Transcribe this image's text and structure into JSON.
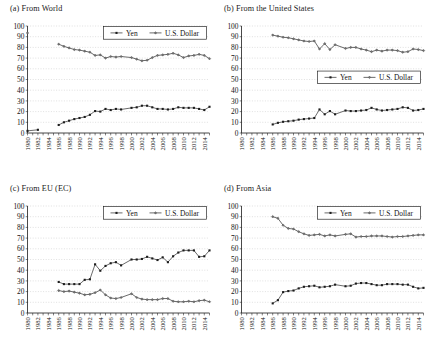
{
  "figure": {
    "panel_labels": [
      "(a) From World",
      "(b) From the United States",
      "(c) From EU (EC)",
      "(d) From Asia"
    ]
  },
  "axes": {
    "y_ticks": [
      "0",
      "10",
      "20",
      "30",
      "40",
      "50",
      "60",
      "70",
      "80",
      "90",
      "100"
    ],
    "ylim": [
      0,
      100
    ],
    "x_tick_labels": [
      "1980",
      "1982",
      "1984",
      "1986",
      "1988",
      "1990",
      "1992",
      "1994",
      "1996",
      "1998",
      "2000",
      "2002",
      "2004",
      "2006",
      "2008",
      "2010",
      "2012",
      "2014"
    ],
    "x_all_years": [
      1980,
      1981,
      1982,
      1983,
      1984,
      1985,
      1986,
      1987,
      1988,
      1989,
      1990,
      1991,
      1992,
      1993,
      1994,
      1995,
      1996,
      1997,
      1998,
      1999,
      2000,
      2001,
      2002,
      2003,
      2004,
      2005,
      2006,
      2007,
      2008,
      2009,
      2010,
      2011,
      2012,
      2013,
      2014,
      2015
    ],
    "xlim": [
      1980,
      2015
    ],
    "grid": "horizontal-dotted"
  },
  "legend": {
    "entries": [
      "Yen",
      "U.S. Dollar"
    ],
    "marker_yen": "filled-square",
    "marker_usd": "filled-diamond"
  },
  "chart_data": [
    {
      "type": "line",
      "title": "(a) From World",
      "xlabel": "",
      "ylabel": "",
      "ylim": [
        0,
        100
      ],
      "grid": true,
      "legend_position": "top-right",
      "series": [
        {
          "name": "Yen",
          "x": [
            1980,
            1982,
            1984,
            1986,
            1987,
            1988,
            1989,
            1990,
            1991,
            1992,
            1993,
            1994,
            1995,
            1996,
            1997,
            1998,
            2000,
            2001,
            2002,
            2003,
            2004,
            2005,
            2006,
            2007,
            2008,
            2009,
            2010,
            2011,
            2012,
            2013,
            2014,
            2015
          ],
          "values": [
            2,
            3,
            null,
            7.5,
            10,
            11.5,
            13,
            14,
            15,
            17,
            20.5,
            20,
            22.5,
            21.5,
            22.5,
            22,
            23.5,
            24,
            25.5,
            25.5,
            24,
            22.5,
            22.5,
            22,
            22.5,
            24,
            23.5,
            23.5,
            23.5,
            22.5,
            21.5,
            24.5
          ]
        },
        {
          "name": "U.S. Dollar",
          "x": [
            1980,
            1982,
            1984,
            1986,
            1987,
            1988,
            1989,
            1990,
            1991,
            1992,
            1993,
            1994,
            1995,
            1996,
            1997,
            1998,
            2000,
            2001,
            2002,
            2003,
            2004,
            2005,
            2006,
            2007,
            2008,
            2009,
            2010,
            2011,
            2012,
            2013,
            2014,
            2015
          ],
          "values": [
            93.5,
            null,
            null,
            83,
            81,
            79.5,
            78,
            77.5,
            76.5,
            75.5,
            72.5,
            73,
            70,
            71.5,
            71,
            71.5,
            70.5,
            69,
            67.5,
            68,
            70.5,
            72.5,
            73,
            73.5,
            74.5,
            73,
            70.5,
            72,
            72.5,
            73.5,
            72.5,
            69.5
          ]
        }
      ]
    },
    {
      "type": "line",
      "title": "(b) From the United States",
      "xlabel": "",
      "ylabel": "",
      "ylim": [
        0,
        100
      ],
      "grid": true,
      "legend_position": "middle-right",
      "series": [
        {
          "name": "Yen",
          "x": [
            1986,
            1987,
            1988,
            1989,
            1990,
            1991,
            1992,
            1993,
            1994,
            1995,
            1996,
            1997,
            1998,
            2000,
            2001,
            2002,
            2003,
            2004,
            2005,
            2006,
            2007,
            2008,
            2009,
            2010,
            2011,
            2012,
            2013,
            2014,
            2015
          ],
          "values": [
            8,
            9.5,
            10.5,
            11,
            11.5,
            12.5,
            13,
            13.5,
            14,
            22,
            17.5,
            20.5,
            17.5,
            21,
            20.5,
            20.5,
            21,
            21.5,
            23.5,
            22,
            21,
            21.5,
            22,
            22.5,
            24,
            23.5,
            21,
            21.5,
            22.5
          ]
        },
        {
          "name": "U.S. Dollar",
          "x": [
            1986,
            1987,
            1988,
            1989,
            1990,
            1991,
            1992,
            1993,
            1994,
            1995,
            1996,
            1997,
            1998,
            2000,
            2001,
            2002,
            2003,
            2004,
            2005,
            2006,
            2007,
            2008,
            2009,
            2010,
            2011,
            2012,
            2013,
            2014,
            2015
          ],
          "values": [
            91.5,
            90.5,
            89.5,
            89,
            88,
            87,
            86,
            85.5,
            86,
            78.5,
            83.5,
            78,
            82.5,
            79,
            80,
            80,
            78.5,
            77.5,
            76,
            77.5,
            76.5,
            77.5,
            77.5,
            77,
            75.5,
            76,
            78.5,
            78,
            77
          ]
        }
      ]
    },
    {
      "type": "line",
      "title": "(c) From EU (EC)",
      "xlabel": "",
      "ylabel": "",
      "ylim": [
        0,
        100
      ],
      "grid": true,
      "legend_position": "top-right",
      "series": [
        {
          "name": "Yen",
          "x": [
            1986,
            1987,
            1988,
            1989,
            1990,
            1991,
            1992,
            1993,
            1994,
            1995,
            1996,
            1997,
            1998,
            2000,
            2001,
            2002,
            2003,
            2004,
            2005,
            2006,
            2007,
            2008,
            2009,
            2010,
            2011,
            2012,
            2013,
            2014,
            2015
          ],
          "values": [
            29,
            27,
            27,
            27,
            27,
            31,
            31.5,
            45.5,
            39.5,
            44,
            46.5,
            47.5,
            44.5,
            50,
            50,
            50.5,
            52.5,
            51,
            49.5,
            52,
            47.5,
            53,
            56.5,
            58.5,
            58.5,
            58.5,
            52.5,
            53,
            58.5
          ]
        },
        {
          "name": "U.S. Dollar",
          "x": [
            1986,
            1987,
            1988,
            1989,
            1990,
            1991,
            1992,
            1993,
            1994,
            1995,
            1996,
            1997,
            1998,
            2000,
            2001,
            2002,
            2003,
            2004,
            2005,
            2006,
            2007,
            2008,
            2009,
            2010,
            2011,
            2012,
            2013,
            2014,
            2015
          ],
          "values": [
            21,
            20,
            20.5,
            19.5,
            18.5,
            17,
            17.5,
            19,
            21.5,
            17,
            14,
            13.5,
            14.5,
            18,
            14.5,
            13,
            12.5,
            12.5,
            12.5,
            13.5,
            13.5,
            11,
            10.5,
            10.5,
            11,
            10.5,
            11.5,
            12,
            10.5
          ]
        }
      ]
    },
    {
      "type": "line",
      "title": "(d) From Asia",
      "xlabel": "",
      "ylabel": "",
      "ylim": [
        0,
        100
      ],
      "grid": true,
      "legend_position": "top-right",
      "series": [
        {
          "name": "Yen",
          "x": [
            1986,
            1987,
            1988,
            1989,
            1990,
            1991,
            1992,
            1993,
            1994,
            1995,
            1996,
            1997,
            1998,
            2000,
            2001,
            2002,
            2003,
            2004,
            2005,
            2006,
            2007,
            2008,
            2009,
            2010,
            2011,
            2012,
            2013,
            2014,
            2015
          ],
          "values": [
            9,
            12,
            19.5,
            20.5,
            21,
            23,
            24.5,
            25,
            25.5,
            24,
            24.5,
            25,
            26.5,
            25,
            25.5,
            27.5,
            28,
            28,
            27,
            26,
            26,
            27,
            27,
            27,
            26.5,
            26.5,
            24.5,
            23,
            23.5
          ]
        },
        {
          "name": "U.S. Dollar",
          "x": [
            1986,
            1987,
            1988,
            1989,
            1990,
            1991,
            1992,
            1993,
            1994,
            1995,
            1996,
            1997,
            1998,
            2000,
            2001,
            2002,
            2003,
            2004,
            2005,
            2006,
            2007,
            2008,
            2009,
            2010,
            2011,
            2012,
            2013,
            2014,
            2015
          ],
          "values": [
            90,
            88.5,
            82,
            79,
            78.5,
            76,
            74,
            72.5,
            73,
            73.5,
            72,
            73,
            72,
            73.5,
            74,
            71,
            71.5,
            71.5,
            72,
            72,
            72,
            71.5,
            71,
            71.5,
            71.5,
            72,
            72.5,
            73,
            73
          ]
        }
      ]
    }
  ]
}
